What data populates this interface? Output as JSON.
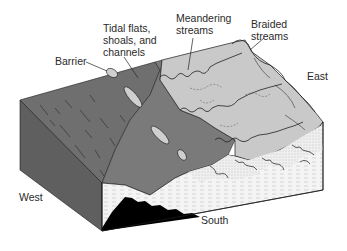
{
  "figure": {
    "type": "block-diagram",
    "labels": {
      "barrier": "Barrier",
      "tidal": "Tidal flats,\nshoals, and\nchannels",
      "meandering": "Meandering\nstreams",
      "braided": "Braided\nstreams",
      "east": "East",
      "west": "West",
      "south": "South"
    },
    "colors": {
      "sea_surface": "#6f6f6f",
      "sea_side_face": "#5e5e5e",
      "tidal_zone": "#7d7d7d",
      "land_surface": "#c9c9c9",
      "south_face": "#f0f0f0",
      "shale_wedge": "#000000",
      "outline": "#1a1a1a",
      "label_text": "#2a2a2a"
    }
  }
}
